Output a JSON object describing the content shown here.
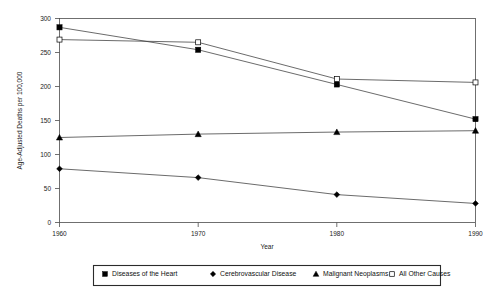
{
  "chart_data": {
    "type": "line",
    "title": "",
    "xlabel": "Year",
    "ylabel": "Age-Adjusted Deaths per 100,000",
    "x": [
      1960,
      1970,
      1980,
      1990
    ],
    "xtick_labels": [
      "1960",
      "1970",
      "1980",
      "1990"
    ],
    "ytick_labels": [
      "0",
      "50",
      "100",
      "150",
      "200",
      "250",
      "300"
    ],
    "yticks": [
      0,
      50,
      100,
      150,
      200,
      250,
      300
    ],
    "ylim": [
      0,
      300
    ],
    "xlim": [
      1960,
      1990
    ],
    "grid": false,
    "legend_position": "bottom-outside",
    "series": [
      {
        "name": "Diseases of the Heart",
        "marker": "filled-square",
        "values": [
          287,
          254,
          203,
          152
        ]
      },
      {
        "name": "Cerebrovascular Disease",
        "marker": "filled-diamond",
        "values": [
          79,
          66,
          41,
          28
        ]
      },
      {
        "name": "Malignant Neoplasms",
        "marker": "filled-triangle",
        "values": [
          125,
          130,
          133,
          135
        ]
      },
      {
        "name": "All Other Causes",
        "marker": "open-square",
        "values": [
          269,
          265,
          211,
          206
        ]
      }
    ]
  },
  "axes": {
    "y_axis_title": "Age-Adjusted Deaths per 100,000",
    "x_axis_title": "Year",
    "ytick_0": "0",
    "ytick_50": "50",
    "ytick_100": "100",
    "ytick_150": "150",
    "ytick_200": "200",
    "ytick_250": "250",
    "ytick_300": "300",
    "xtick_1960": "1960",
    "xtick_1970": "1970",
    "xtick_1980": "1980",
    "xtick_1990": "1990"
  },
  "legend": {
    "items": [
      {
        "label": "Diseases of the Heart",
        "marker": "filled-square"
      },
      {
        "label": "Cerebrovascular Disease",
        "marker": "filled-diamond"
      },
      {
        "label": "Malignant Neoplasms",
        "marker": "filled-triangle"
      },
      {
        "label": "All Other Causes",
        "marker": "open-square"
      }
    ]
  },
  "colors": {
    "line": "#3a3a3a",
    "marker": "#000000",
    "frame": "#4c4c4c",
    "text": "#1a1a1a",
    "background": "#ffffff"
  }
}
